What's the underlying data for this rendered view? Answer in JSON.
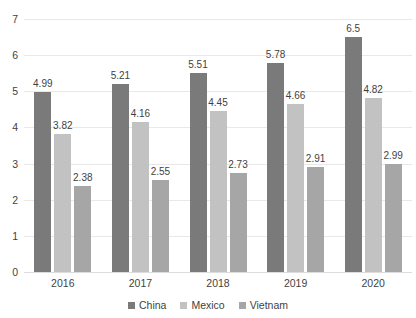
{
  "chart_data": {
    "type": "bar",
    "title": "",
    "xlabel": "",
    "ylabel": "",
    "categories": [
      "2016",
      "2017",
      "2018",
      "2019",
      "2020"
    ],
    "series": [
      {
        "name": "China",
        "color": "#7a7a7a",
        "values": [
          4.99,
          5.21,
          5.51,
          5.78,
          6.5
        ]
      },
      {
        "name": "Mexico",
        "color": "#c2c2c2",
        "values": [
          3.82,
          4.16,
          4.45,
          4.66,
          4.82
        ]
      },
      {
        "name": "Vietnam",
        "color": "#a6a6a6",
        "values": [
          2.38,
          2.55,
          2.73,
          2.91,
          2.99
        ]
      }
    ],
    "data_labels": [
      [
        "4.99",
        "5.21",
        "5.51",
        "5.78",
        "6.5"
      ],
      [
        "3.82",
        "4.16",
        "4.45",
        "4.66",
        "4.82"
      ],
      [
        "2.38",
        "2.55",
        "2.73",
        "2.91",
        "2.99"
      ]
    ],
    "ylim": [
      0,
      7
    ],
    "yticks": [
      "0",
      "1",
      "2",
      "3",
      "4",
      "5",
      "6",
      "7"
    ],
    "grid": true,
    "legend_position": "bottom"
  }
}
